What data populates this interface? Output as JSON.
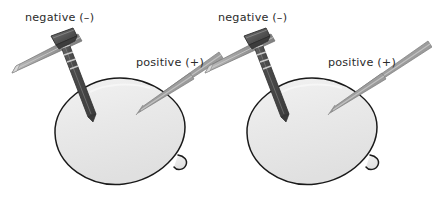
{
  "figure": {
    "name": "lemon-battery-electrode-diagram",
    "width": 432,
    "height": 204,
    "background_color": "#ffffff"
  },
  "colors": {
    "background": "#ffffff",
    "lemon_fill": "#e6e6e6",
    "lemon_fill_light": "#f0f0f0",
    "lemon_outline": "#1a1a1a",
    "nail_dark": "#4a4a4a",
    "nail_darker": "#3a3a3a",
    "nail_head": "#5a5a5a",
    "electrode_gray": "#9a9a9a",
    "electrode_gray_light": "#b8b8b8",
    "electrode_gray_dark": "#7d7d7d",
    "text": "#2b2b2b"
  },
  "cells": [
    {
      "id": "left-cell",
      "lemon": {
        "name": "lemon-left",
        "center_x": 120,
        "center_y": 131,
        "radius_x": 65,
        "radius_y": 53
      },
      "labels": {
        "negative": "negative (–)",
        "positive": "positive (+)"
      },
      "negative_label_x": 25,
      "negative_label_y": 21,
      "positive_label_x": 136,
      "positive_label_y": 66,
      "electrodes": [
        {
          "name": "nail-negative",
          "polarity": "negative",
          "type": "galvanized-nail"
        },
        {
          "name": "strip-positive",
          "polarity": "positive",
          "type": "copper-strip"
        },
        {
          "name": "wire-lead",
          "polarity": "negative",
          "type": "lead-bar"
        }
      ]
    },
    {
      "id": "right-cell",
      "lemon": {
        "name": "lemon-right",
        "center_x": 312,
        "center_y": 131,
        "radius_x": 65,
        "radius_y": 53
      },
      "labels": {
        "negative": "negative (–)",
        "positive": "positive (+)"
      },
      "negative_label_x": 218,
      "negative_label_y": 21,
      "positive_label_x": 328,
      "positive_label_y": 66,
      "electrodes": [
        {
          "name": "nail-negative",
          "polarity": "negative",
          "type": "galvanized-nail"
        },
        {
          "name": "strip-positive",
          "polarity": "positive",
          "type": "copper-strip"
        },
        {
          "name": "wire-lead",
          "polarity": "negative",
          "type": "lead-bar"
        }
      ]
    }
  ]
}
